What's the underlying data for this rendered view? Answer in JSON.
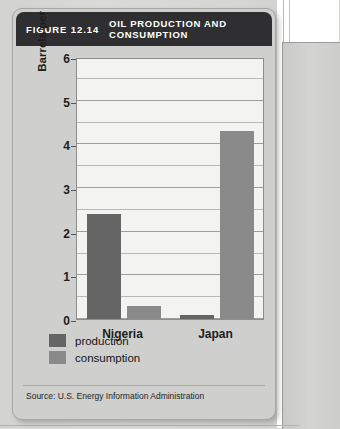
{
  "figure": {
    "number": "FIGURE 12.14",
    "title": "OIL PRODUCTION AND CONSUMPTION",
    "source": "Source: U.S. Energy Information Administration"
  },
  "colors": {
    "title_bar": "#2f2f31",
    "card": "#cfcfcd",
    "plot_background": "#f3f3f1",
    "production": "#656565",
    "consumption": "#8a8a8a",
    "gridline": "#b9b9b7",
    "axis": "#8d8d8b"
  },
  "chart_data": {
    "type": "bar",
    "title": "OIL PRODUCTION AND CONSUMPTION",
    "xlabel": "",
    "ylabel": "Barrels per day (in millions)",
    "ylim": [
      0,
      6
    ],
    "ytick_labels": [
      "6",
      "5",
      "4",
      "3",
      "2",
      "1",
      "0"
    ],
    "ytick_values": [
      6,
      5,
      4,
      3,
      2,
      1,
      0
    ],
    "minor_gridline_step": 0.5,
    "grid": true,
    "legend_position": "below-left",
    "categories": [
      "Nigeria",
      "Japan"
    ],
    "series": [
      {
        "name": "production",
        "color": "#656565",
        "values": [
          2.4,
          0.1
        ]
      },
      {
        "name": "consumption",
        "color": "#8a8a8a",
        "values": [
          0.3,
          4.3
        ]
      }
    ]
  }
}
